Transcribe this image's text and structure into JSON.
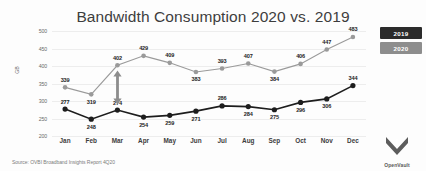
{
  "chart_data": {
    "type": "line",
    "title": "Bandwidth Consumption 2020 vs. 2019",
    "xlabel": "",
    "ylabel": "GB",
    "ylim": [
      200,
      500
    ],
    "yticks": [
      500,
      450,
      400,
      350,
      300,
      250,
      200
    ],
    "grid": true,
    "legend_position": "top-right",
    "categories": [
      "Jan",
      "Feb",
      "Mar",
      "Apr",
      "May",
      "Jun",
      "Jul",
      "Aug",
      "Sep",
      "Oct",
      "Nov",
      "Dec"
    ],
    "series": [
      {
        "name": "2020",
        "color": "#9a9a9a",
        "values": [
          339,
          319,
          402,
          429,
          409,
          383,
          393,
          407,
          384,
          406,
          447,
          483
        ]
      },
      {
        "name": "2019",
        "color": "#1d1d1d",
        "values": [
          277,
          248,
          274,
          254,
          259,
          271,
          286,
          284,
          275,
          296,
          306,
          344
        ]
      }
    ],
    "annotations": [
      {
        "name": "growth-gap-arrow",
        "month": "Mar",
        "type": "double-headed-vertical-arrow"
      }
    ]
  },
  "legend": {
    "items": [
      {
        "label": "2019",
        "color": "#2b2b2b"
      },
      {
        "label": "2020",
        "color": "#8d8d8d"
      }
    ]
  },
  "footer": {
    "source": "Source: OVBI Broadband Insights Report 4Q20"
  },
  "logo": {
    "text": "OpenVault",
    "mark": "chevron-down-icon"
  }
}
